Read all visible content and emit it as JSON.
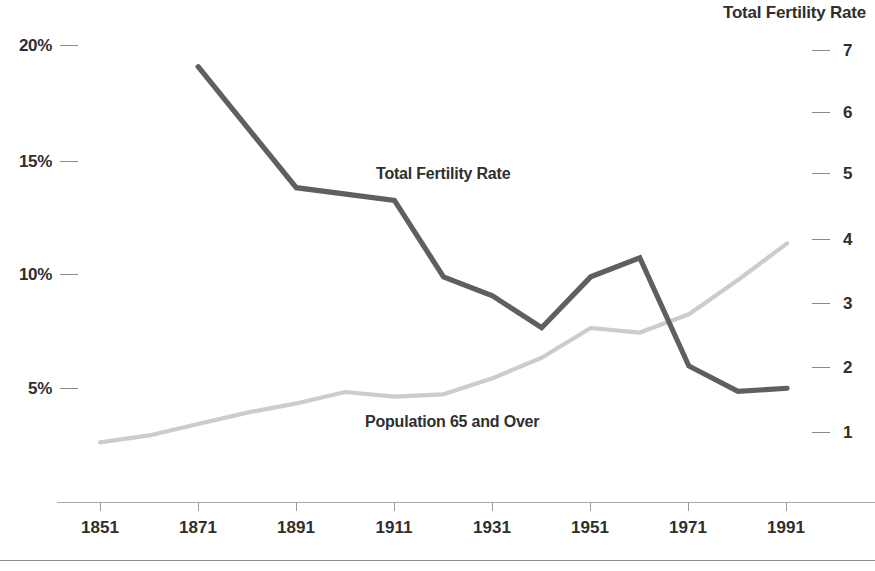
{
  "figure": {
    "background": "#ffffff",
    "footer_rule_color": "#8f8f8f",
    "cropped_top_title": ""
  },
  "axes": {
    "left": {
      "title": "",
      "ticks": [
        "5%",
        "10%",
        "15%",
        "20%"
      ],
      "tick_color": "#8a8a8a"
    },
    "right": {
      "title": "Total Fertility Rate",
      "ticks": [
        "1",
        "2",
        "3",
        "4",
        "5",
        "6",
        "7"
      ],
      "tick_color": "#8a8a8a"
    },
    "x": {
      "ticks": [
        "1851",
        "1871",
        "1891",
        "1911",
        "1931",
        "1951",
        "1971",
        "1991"
      ],
      "line_color": "#a9a9a9"
    }
  },
  "series_labels": {
    "fertility": "Total Fertility Rate",
    "population": "Population 65 and Over"
  },
  "colors": {
    "fertility_line": "#5f5f5f",
    "population_line": "#cccccc",
    "text": "#2f2f2f"
  },
  "chart_data": {
    "type": "line",
    "title": "",
    "subtitle": "",
    "xlabel": "",
    "ylabel": "Population 65 and Over (%)",
    "y2label": "Total Fertility Rate",
    "grid": false,
    "legend": "inline-annotations",
    "xlim": [
      1851,
      1991
    ],
    "ylim": [
      0,
      22
    ],
    "y2lim": [
      0,
      7.6
    ],
    "xticks": [
      1851,
      1871,
      1891,
      1911,
      1931,
      1951,
      1971,
      1991
    ],
    "yticks": [
      5,
      10,
      15,
      20
    ],
    "ytick_labels": [
      "5%",
      "10%",
      "15%",
      "20%"
    ],
    "y2ticks": [
      1,
      2,
      3,
      4,
      5,
      6,
      7
    ],
    "series": [
      {
        "name": "Total Fertility Rate",
        "axis": "right",
        "color": "#5f5f5f",
        "x": [
          1871,
          1891,
          1911,
          1921,
          1931,
          1941,
          1951,
          1961,
          1971,
          1981,
          1991
        ],
        "values": [
          6.8,
          4.9,
          4.7,
          3.5,
          3.2,
          2.7,
          3.5,
          3.8,
          2.1,
          1.7,
          1.75
        ]
      },
      {
        "name": "Population 65 and Over",
        "axis": "left",
        "color": "#cccccc",
        "x": [
          1851,
          1861,
          1871,
          1881,
          1891,
          1901,
          1911,
          1921,
          1931,
          1941,
          1951,
          1961,
          1971,
          1981,
          1991
        ],
        "values": [
          2.8,
          3.1,
          3.6,
          4.1,
          4.5,
          5.0,
          4.8,
          4.9,
          5.6,
          6.5,
          7.8,
          7.6,
          8.4,
          9.9,
          11.5
        ]
      }
    ],
    "annotations": [
      {
        "text": "Total Fertility Rate",
        "x": 1911,
        "y": 4.9,
        "axis": "right"
      },
      {
        "text": "Population 65 and Over",
        "x": 1931,
        "y": 4.2,
        "axis": "left"
      }
    ]
  }
}
